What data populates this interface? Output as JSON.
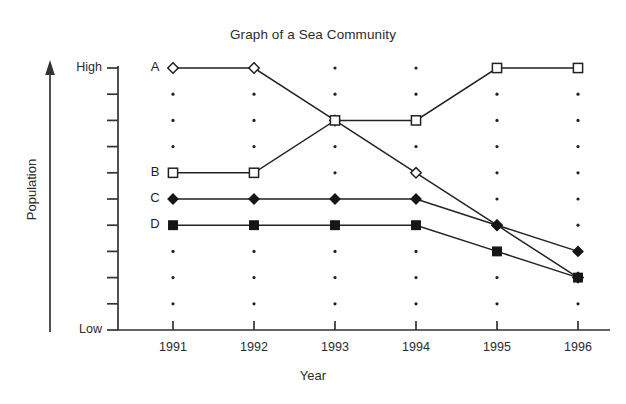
{
  "chart_data": {
    "type": "line",
    "title": "Graph of a Sea Community",
    "xlabel": "Year",
    "ylabel": "Population",
    "categories": [
      "1991",
      "1992",
      "1993",
      "1994",
      "1995",
      "1996"
    ],
    "x": [
      1991,
      1992,
      1993,
      1994,
      1995,
      1996
    ],
    "ylim": [
      "Low",
      "High"
    ],
    "y_axis_ticks": [
      "High",
      "",
      "",
      "",
      "",
      "",
      "",
      "",
      "",
      "",
      "Low"
    ],
    "y_tick_count": 11,
    "y_level_count": 10,
    "grid": "dotted",
    "grid_dots": true,
    "legend_position": "inline-left-labels",
    "y_axis_arrow": true,
    "series": [
      {
        "name": "A",
        "label": "A",
        "marker": "open-diamond",
        "values": [
          1,
          1,
          3,
          5,
          7,
          9
        ],
        "value_scale_note": "grid level 1 = High, 10 = near Low",
        "qualitative": [
          "High",
          "High",
          "upper-middle",
          "middle",
          "lower-middle",
          "low"
        ]
      },
      {
        "name": "B",
        "label": "B",
        "marker": "open-square",
        "values": [
          5,
          5,
          3,
          3,
          1,
          1
        ],
        "qualitative": [
          "middle",
          "middle",
          "upper-middle",
          "upper-middle",
          "High",
          "High"
        ]
      },
      {
        "name": "C",
        "label": "C",
        "marker": "filled-diamond",
        "values": [
          6,
          6,
          6,
          6,
          7,
          8
        ],
        "qualitative": [
          "middle",
          "middle",
          "middle",
          "middle",
          "lower-middle",
          "low"
        ]
      },
      {
        "name": "D",
        "label": "D",
        "marker": "filled-square",
        "values": [
          7,
          7,
          7,
          7,
          8,
          9
        ],
        "qualitative": [
          "middle",
          "middle",
          "middle",
          "middle",
          "low",
          "low"
        ]
      }
    ],
    "colors": {
      "axis": "#333333",
      "line": "#222222",
      "marker_open_fill": "#ffffff",
      "marker_filled": "#161616",
      "background": "#ffffff",
      "text": "#2b2b2b"
    }
  },
  "labels": {
    "y_high": "High",
    "y_low": "Low",
    "y_axis_title": "Population",
    "x_axis_title": "Year"
  }
}
